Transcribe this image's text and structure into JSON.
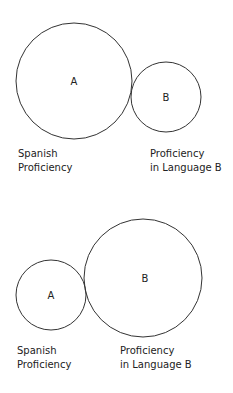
{
  "diagrams": [
    {
      "circles": [
        {
          "letter": "A",
          "cx": 74,
          "cy": 81,
          "r": 58
        },
        {
          "letter": "B",
          "cx": 166,
          "cy": 97,
          "r": 35
        }
      ],
      "labels": {
        "left": {
          "line1": "Spanish",
          "line2": "Proficiency"
        },
        "right": {
          "line1": "Proficiency",
          "line2": "in Language B"
        }
      }
    },
    {
      "circles": [
        {
          "letter": "A",
          "cx": 51,
          "cy": 295,
          "r": 35
        },
        {
          "letter": "B",
          "cx": 143,
          "cy": 278,
          "r": 59
        }
      ],
      "labels": {
        "left": {
          "line1": "Spanish",
          "line2": "Proficiency"
        },
        "right": {
          "line1": "Proficiency",
          "line2": "in Language B"
        }
      }
    }
  ],
  "colors": {
    "stroke": "#333333",
    "text": "#222222",
    "background": "#ffffff"
  }
}
